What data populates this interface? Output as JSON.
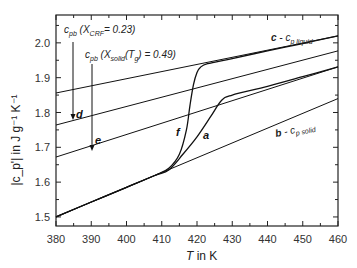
{
  "chart_data": {
    "type": "line",
    "title": "",
    "xlabel": "T in K",
    "ylabel": "|c_p'| in J g^-1 K^-1",
    "xlim": [
      380,
      460
    ],
    "ylim": [
      1.474,
      2.08
    ],
    "xticks": [
      380,
      390,
      400,
      410,
      420,
      430,
      440,
      450,
      460
    ],
    "yticks": [
      1.5,
      1.6,
      1.7,
      1.8,
      1.9,
      2.0
    ],
    "grid": false,
    "legend": "none",
    "series": [
      {
        "name": "c - c_p liquid",
        "style": "straight baseline",
        "x": [
          380,
          460
        ],
        "y": [
          1.856,
          2.02
        ]
      },
      {
        "name": "d",
        "style": "straight baseline",
        "x": [
          380,
          460
        ],
        "y": [
          1.764,
          1.977
        ]
      },
      {
        "name": "e",
        "style": "straight baseline",
        "x": [
          380,
          460
        ],
        "y": [
          1.672,
          1.931
        ]
      },
      {
        "name": "b - c_p solid",
        "style": "straight baseline",
        "x": [
          380,
          460
        ],
        "y": [
          1.5,
          1.84
        ]
      },
      {
        "name": "f",
        "style": "measured",
        "x": [
          380,
          390,
          400,
          408,
          412,
          415,
          417,
          418,
          419,
          420,
          421,
          423,
          430,
          440,
          450,
          460
        ],
        "y": [
          1.5,
          1.543,
          1.585,
          1.619,
          1.64,
          1.68,
          1.75,
          1.82,
          1.88,
          1.915,
          1.93,
          1.94,
          1.955,
          1.977,
          1.998,
          2.02
        ]
      },
      {
        "name": "a",
        "style": "measured",
        "x": [
          380,
          390,
          400,
          408,
          412,
          416,
          420,
          424,
          427,
          430,
          440,
          450,
          460
        ],
        "y": [
          1.5,
          1.543,
          1.585,
          1.619,
          1.635,
          1.68,
          1.73,
          1.79,
          1.835,
          1.85,
          1.875,
          1.903,
          1.931
        ]
      }
    ],
    "annotations": [
      {
        "text": "c_pb (X_CRF = 0.23)",
        "x": 383,
        "y": 2.03,
        "arrow_to": [
          384,
          1.78
        ],
        "label": "d"
      },
      {
        "text": "c_pb (X_solid(T_g) = 0.49)",
        "x": 390,
        "y": 1.985,
        "arrow_to": [
          390,
          1.695
        ],
        "label": "e"
      },
      {
        "text": "c - c_p liquid",
        "x": 443,
        "y": 2.02
      },
      {
        "text": "b - c_p solid",
        "x": 443,
        "y": 1.735
      },
      {
        "text": "f",
        "x": 418,
        "y": 1.73
      },
      {
        "text": "a",
        "x": 423,
        "y": 1.725
      }
    ]
  },
  "axes": {
    "x_title_T": "T",
    "x_title_rest": " in K",
    "y_title": "|c_p'| in J g⁻¹ K⁻¹",
    "x_ticks": [
      "380",
      "390",
      "400",
      "410",
      "420",
      "430",
      "440",
      "450",
      "460"
    ],
    "y_ticks": [
      "1.5",
      "1.6",
      "1.7",
      "1.8",
      "1.9",
      "2.0"
    ]
  },
  "labels": {
    "ann1_c": "c",
    "ann1_sub": "pb",
    "ann1_rest": " (X",
    "ann1_sub2": "CRF",
    "ann1_val": "= 0.23)",
    "ann2_c": "c",
    "ann2_sub": "pb",
    "ann2_rest": " (X",
    "ann2_sub2": "solid",
    "ann2_mid": "(T",
    "ann2_sub3": "g",
    "ann2_val": ") = 0.49)",
    "d": "d",
    "e": "e",
    "f": "f",
    "a": "a",
    "c_prefix": "c",
    "c_mid": " - c",
    "c_sub": "p liquid",
    "b_prefix": "b",
    "b_mid": " - c",
    "b_sub": "p solid"
  }
}
